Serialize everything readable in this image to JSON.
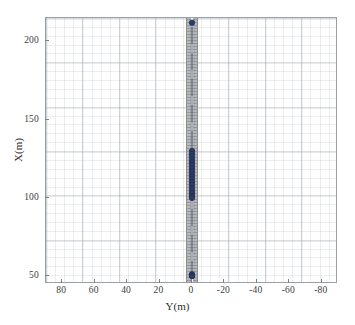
{
  "figure": {
    "background_color": "#ffffff",
    "axes_border_color": "#9aa0a6",
    "grid_color": "#c3c8d0"
  },
  "chart_data": {
    "type": "scatter",
    "title": "",
    "xlabel": "Y(m)",
    "ylabel": "X(m)",
    "xlim": [
      90,
      -90
    ],
    "ylim": [
      45,
      215
    ],
    "x_reversed": true,
    "grid": true,
    "legend": "none",
    "xticks": [
      80,
      60,
      40,
      20,
      0,
      -20,
      -40,
      -60,
      -80
    ],
    "xticklabels": [
      "80",
      "60",
      "40",
      "20",
      "0",
      "-20",
      "-40",
      "-60",
      "-80"
    ],
    "yticks": [
      50,
      100,
      150,
      200
    ],
    "yticklabels": [
      "50",
      "100",
      "150",
      "200"
    ],
    "xminortick_step": 5,
    "yminortick_step": 5,
    "marker": {
      "shape": "circle",
      "color": "#2b3c6b",
      "edge_color": "#1d2a4d",
      "size_px": 5.4
    },
    "line": {
      "color": "#3c4f7d",
      "width_px": 0.9,
      "style": "solid"
    },
    "series": [
      {
        "name": "vehicle-trajectory",
        "x": [
          0.0,
          0.0,
          0.0,
          0.0,
          0.0,
          0.0,
          0.0,
          0.0,
          0.0,
          0.0,
          0.0,
          0.0,
          0.0,
          0.0,
          0.0,
          0.0,
          0.0,
          0.0,
          0.0,
          0.0,
          0.0,
          0.0
        ],
        "y": [
          212.0,
          130.0,
          128.2,
          126.4,
          124.6,
          122.8,
          121.0,
          119.2,
          117.4,
          115.6,
          113.8,
          112.0,
          110.2,
          108.4,
          106.6,
          104.8,
          103.0,
          101.4,
          100.0,
          51.2,
          50.4,
          50.0
        ]
      }
    ],
    "annotations": [
      {
        "name": "road-corridor",
        "type": "patch",
        "shape": "vertical-band",
        "x_center": 0,
        "half_width_m": 3.5,
        "y_from": 45,
        "y_to": 215,
        "fill_color": "#b9b9b9",
        "edge_color": "#8e8e8e",
        "hatch": "horizontal-lines"
      },
      {
        "name": "lane-centre-dashed-line",
        "type": "line",
        "x": 0,
        "color": "#ffffff",
        "style": "dashed"
      }
    ]
  }
}
